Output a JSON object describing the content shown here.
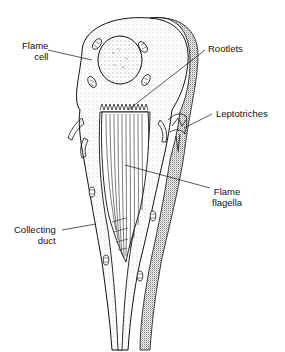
{
  "figure": {
    "labels": {
      "flame_cell_line1": "Flame",
      "flame_cell_line2": "cell",
      "rootlets": "Rootlets",
      "leptotriches": "Leptotriches",
      "flame_flagella_line1": "Flame",
      "flame_flagella_line2": "flagella",
      "collecting_duct_line1": "Collecting",
      "collecting_duct_line2": "duct"
    },
    "colors": {
      "ink": "#111111",
      "background": "#ffffff",
      "stipple": "#8a8a8a"
    }
  }
}
